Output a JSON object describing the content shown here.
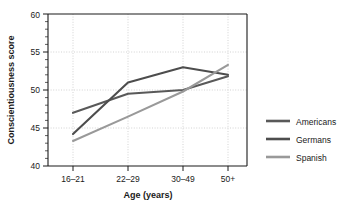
{
  "chart_data": {
    "type": "line",
    "title": "",
    "xlabel": "Age (years)",
    "ylabel": "Conscientiousness score",
    "categories": [
      "16–21",
      "22–29",
      "30–49",
      "50+"
    ],
    "ylim": [
      40,
      60
    ],
    "yticks": [
      40,
      45,
      50,
      55,
      60
    ],
    "ytick_labels": [
      "40",
      "45",
      "50",
      "55",
      "60"
    ],
    "grid": true,
    "legend_position": "right",
    "series": [
      {
        "name": "Americans",
        "color": "#595959",
        "values": [
          47.0,
          49.5,
          50.0,
          51.8
        ]
      },
      {
        "name": "Germans",
        "color": "#4d4d4d",
        "values": [
          44.2,
          51.0,
          53.0,
          52.0
        ]
      },
      {
        "name": "Spanish",
        "color": "#999999",
        "values": [
          43.3,
          46.5,
          49.8,
          53.3
        ]
      }
    ]
  },
  "axis": {
    "y_title": "Conscientiousness score",
    "x_title": "Age (years)",
    "y_tick_0": "40",
    "y_tick_1": "45",
    "y_tick_2": "50",
    "y_tick_3": "55",
    "y_tick_4": "60",
    "x_tick_0": "16–21",
    "x_tick_1": "22–29",
    "x_tick_2": "30–49",
    "x_tick_3": "50+"
  },
  "legend": {
    "item_0": "Americans",
    "item_1": "Germans",
    "item_2": "Spanish"
  },
  "colors": {
    "americans": "#595959",
    "germans": "#4d4d4d",
    "spanish": "#999999",
    "axis": "#1a1a1a",
    "grid": "#c8c8c8",
    "background": "#ffffff"
  }
}
